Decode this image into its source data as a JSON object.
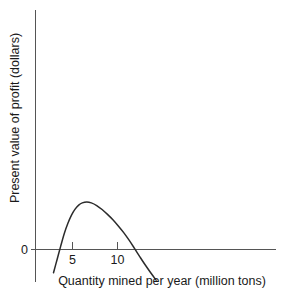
{
  "chart_data": {
    "type": "line",
    "title": "",
    "subtitle": "",
    "xlabel": "Quantity mined per year (million tons)",
    "ylabel": "Present value of profit (dollars)",
    "xlim": [
      0,
      16
    ],
    "ylim": [
      -1.05,
      4.2
    ],
    "grid": false,
    "legend": "none",
    "x_ticks": [
      5,
      10
    ],
    "x_tick_labels": [
      "5",
      "10"
    ],
    "y_ticks": [
      0
    ],
    "y_tick_labels": [
      "0"
    ],
    "annotations": [],
    "series": [
      {
        "name": "Present value of profit",
        "x": [
          2.0,
          2.4,
          2.8,
          3.2,
          3.6,
          4.0,
          4.4,
          4.8,
          5.2,
          5.7,
          6.2,
          6.8,
          7.4,
          8.0,
          8.6,
          9.2,
          9.8,
          10.4,
          11.0,
          11.6,
          12.2,
          12.8,
          13.4
        ],
        "y": [
          -1.05,
          -0.45,
          0.15,
          0.72,
          1.18,
          1.55,
          1.82,
          2.0,
          2.1,
          2.14,
          2.1,
          1.98,
          1.8,
          1.58,
          1.34,
          1.06,
          0.76,
          0.42,
          0.05,
          -0.33,
          -0.7,
          -1.05,
          -1.38
        ]
      }
    ]
  },
  "axes": {
    "y_axis_label": "Present value of profit (dollars)",
    "x_axis_label": "Quantity mined per year (million tons)",
    "zero_label": "0",
    "tick_5": "5",
    "tick_10": "10"
  },
  "colors": {
    "curve": "#2b2b2b",
    "axis": "#555555",
    "background": "#ffffff",
    "text": "#1a1a1a"
  }
}
